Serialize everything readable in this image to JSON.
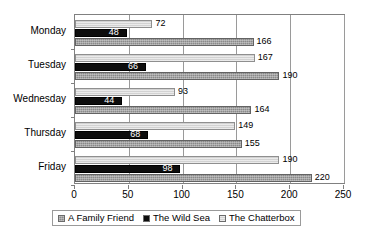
{
  "chart_data": {
    "type": "bar",
    "orientation": "horizontal",
    "title": "",
    "xlabel": "",
    "ylabel": "",
    "categories": [
      "Monday",
      "Tuesday",
      "Wednesday",
      "Thursday",
      "Friday"
    ],
    "series": [
      {
        "name": "A Family Friend",
        "color": "#8a8a8a",
        "values": [
          166,
          190,
          164,
          155,
          220
        ]
      },
      {
        "name": "The Wild Sea",
        "color": "#0d0d0d",
        "values": [
          48,
          66,
          44,
          68,
          98
        ]
      },
      {
        "name": "The Chatterbox",
        "color": "#d2d2d2",
        "values": [
          72,
          167,
          93,
          149,
          190
        ]
      }
    ],
    "series_draw_order": [
      "The Chatterbox",
      "The Wild Sea",
      "A Family Friend"
    ],
    "xlim": [
      0,
      250
    ],
    "xticks": [
      0,
      50,
      100,
      150,
      200,
      250
    ],
    "xtick_labels": [
      "0",
      "50",
      "100",
      "150",
      "200",
      "250"
    ],
    "grid": true,
    "grid_axis": "x",
    "data_labels": true,
    "legend_position": "bottom"
  },
  "legend": {
    "items": [
      {
        "label": "A Family Friend",
        "swatch": "family-friend-swatch"
      },
      {
        "label": "The Wild Sea",
        "swatch": "wild-sea-swatch"
      },
      {
        "label": "The Chatterbox",
        "swatch": "chatterbox-swatch"
      }
    ]
  },
  "colors": {
    "family_friend": "#8a8a8a",
    "wild_sea": "#0d0d0d",
    "chatterbox": "#d2d2d2",
    "axis": "#808080",
    "grid": "#9a9a9a",
    "text": "#000000",
    "background": "#ffffff"
  }
}
